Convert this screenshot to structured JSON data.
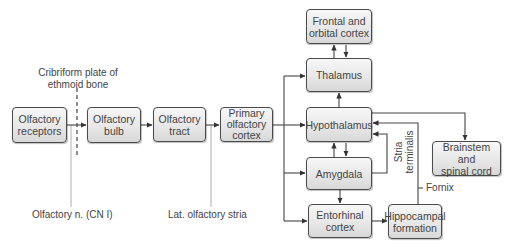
{
  "diagram": {
    "nodes": {
      "olfactory_receptors": "Olfactory\nreceptors",
      "olfactory_bulb": "Olfactory\nbulb",
      "olfactory_tract": "Olfactory\ntract",
      "primary_olfactory_cortex": "Primary\nolfactory\ncortex",
      "frontal_orbital_cortex": "Frontal and\norbital cortex",
      "thalamus": "Thalamus",
      "hypothalamus": "Hypothalamus",
      "amygdala": "Amygdala",
      "entorhinal_cortex": "Entorhinal\ncortex",
      "hippocampal_formation": "Hippocampal\nformation",
      "brainstem_spinal_cord": "Brainstem and\nspinal cord"
    },
    "annotations": {
      "cribriform_plate": "Cribriform plate of\nethmoid bone",
      "olfactory_nerve": "Olfactory n. (CN I)",
      "lateral_olfactory_stria": "Lat. olfactory stria",
      "stria_terminalis": "Stria\nterminalis",
      "fornix": "Fornix"
    },
    "edges": [
      {
        "from": "Olfactory receptors",
        "to": "Olfactory bulb"
      },
      {
        "from": "Olfactory bulb",
        "to": "Olfactory tract"
      },
      {
        "from": "Olfactory tract",
        "to": "Primary olfactory cortex"
      },
      {
        "from": "Primary olfactory cortex",
        "to": "Thalamus"
      },
      {
        "from": "Primary olfactory cortex",
        "to": "Hypothalamus"
      },
      {
        "from": "Primary olfactory cortex",
        "to": "Amygdala"
      },
      {
        "from": "Primary olfactory cortex",
        "to": "Entorhinal cortex"
      },
      {
        "from": "Thalamus",
        "to": "Frontal and orbital cortex"
      },
      {
        "from": "Frontal and orbital cortex",
        "to": "Thalamus"
      },
      {
        "from": "Hypothalamus",
        "to": "Thalamus"
      },
      {
        "from": "Hypothalamus",
        "to": "Amygdala"
      },
      {
        "from": "Amygdala",
        "to": "Hypothalamus"
      },
      {
        "from": "Amygdala",
        "to": "Hypothalamus",
        "via": "Stria terminalis"
      },
      {
        "from": "Amygdala",
        "to": "Entorhinal cortex"
      },
      {
        "from": "Entorhinal cortex",
        "to": "Hippocampal formation"
      },
      {
        "from": "Hippocampal formation",
        "to": "Hypothalamus",
        "via": "Fornix"
      },
      {
        "from": "Hypothalamus",
        "to": "Brainstem and spinal cord"
      }
    ]
  }
}
